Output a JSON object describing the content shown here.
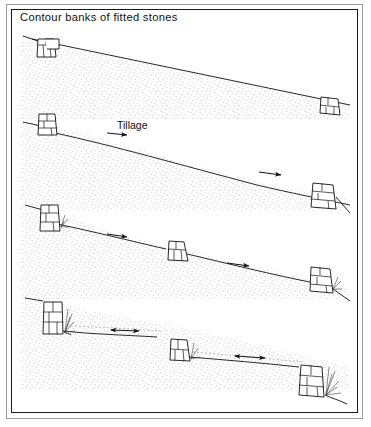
{
  "figure": {
    "title": "Contour banks of fitted stones",
    "kind": "line-drawing-diagram",
    "panel_count": 4,
    "background_color": "#ffffff",
    "line_color": "#111111",
    "frame_color": "#1a1a1a",
    "outer_frame_color": "#9a9a9a"
  },
  "labels": {
    "title": "Contour banks of fitted stones",
    "tillage": "Tillage"
  },
  "panels": [
    {
      "index": 1,
      "name": "initial-slope",
      "description": "Uniform steep slope with two low contour stone banks",
      "bank_count": 2,
      "arrows": [],
      "vegetation": false
    },
    {
      "index": 2,
      "name": "tillage-begins",
      "description": "Tillage moves soil downslope; soil accumulates behind banks",
      "bank_count": 2,
      "arrows": [
        "tillage-arrow-left",
        "tillage-arrow-right"
      ],
      "vegetation": false
    },
    {
      "index": 3,
      "name": "soil-accumulation",
      "description": "Three banks, slope breaks into gentler segments, vegetation starts at banks",
      "bank_count": 3,
      "arrows": [
        "tillage-arrow-left",
        "tillage-arrow-right"
      ],
      "vegetation": true
    },
    {
      "index": 4,
      "name": "terraces-formed",
      "description": "Stone walls heightened, near-level terrace benches between banks",
      "bank_count": 3,
      "arrows": [
        "level-arrow-left",
        "level-arrow-right"
      ],
      "vegetation": true
    }
  ],
  "icons": {
    "tillage_arrow": "arrow-right-icon",
    "level_arrow": "arrow-left-right-icon",
    "stone_bank": "stone-bank-icon",
    "vegetation": "grass-tuft-icon"
  }
}
